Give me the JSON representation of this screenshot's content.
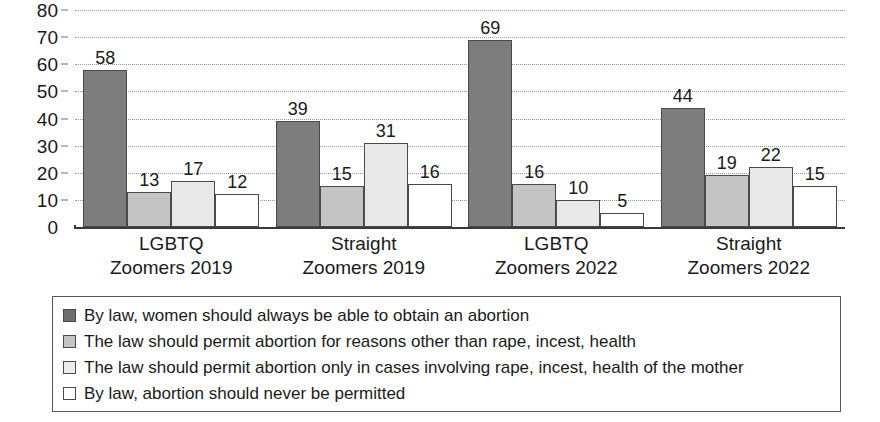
{
  "chart_data": {
    "type": "bar",
    "title": "",
    "subtitle": "",
    "xlabel": "",
    "ylabel": "",
    "ylim": [
      0,
      80
    ],
    "ytick_step": 10,
    "yticks": [
      80,
      70,
      60,
      50,
      40,
      30,
      20,
      10,
      0
    ],
    "grid": true,
    "grid_style": "dotted-horizontal",
    "legend_position": "below-plot-boxed",
    "categories": [
      "LGBTQ Zoomers 2019",
      "Straight Zoomers 2019",
      "LGBTQ Zoomers 2022",
      "Straight Zoomers 2022"
    ],
    "category_lines": [
      [
        "LGBTQ",
        "Zoomers 2019"
      ],
      [
        "Straight",
        "Zoomers 2019"
      ],
      [
        "LGBTQ",
        "Zoomers 2022"
      ],
      [
        "Straight",
        "Zoomers 2022"
      ]
    ],
    "series": [
      {
        "name": "By law, women should always be able to obtain an abortion",
        "color": "#7d7d7d",
        "values": [
          58,
          39,
          69,
          44
        ]
      },
      {
        "name": "The law should permit abortion for reasons other than rape, incest, health",
        "color": "#c4c4c4",
        "values": [
          13,
          15,
          16,
          19
        ]
      },
      {
        "name": "The law should permit abortion only in cases involving rape, incest, health of the mother",
        "color": "#e8e8e8",
        "values": [
          17,
          31,
          10,
          22
        ]
      },
      {
        "name": "By law, abortion should never be permitted",
        "color": "#ffffff",
        "values": [
          12,
          16,
          5,
          15
        ]
      }
    ]
  },
  "legend": {
    "items": [
      {
        "label": "By law, women should always be able to obtain an abortion",
        "swatch": "#7d7d7d"
      },
      {
        "label": "The law should permit abortion for reasons other than rape, incest, health",
        "swatch": "#c4c4c4"
      },
      {
        "label": "The law should permit abortion only in cases involving rape, incest, health of the mother",
        "swatch": "#e8e8e8"
      },
      {
        "label": "By law, abortion should never be permitted",
        "swatch": "#ffffff"
      }
    ]
  },
  "axis": {
    "y_tick_labels": [
      "80",
      "70",
      "60",
      "50",
      "40",
      "30",
      "20",
      "10",
      "0"
    ]
  },
  "colors": {
    "series_0": "#7d7d7d",
    "series_1": "#c4c4c4",
    "series_2": "#e8e8e8",
    "series_3": "#ffffff",
    "gridline": "#9a9a9a",
    "baseline": "#3a3a3a",
    "text": "#1a1a1a",
    "legend_border": "#5a5a5a"
  }
}
